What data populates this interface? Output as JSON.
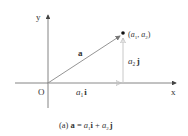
{
  "figure": {
    "axes": {
      "x_label": "x",
      "y_label": "y",
      "origin_label": "O"
    },
    "vector": {
      "name": "a",
      "point_label": {
        "open": "(",
        "a1": "a",
        "sub1": "1",
        "comma": ", ",
        "a2": "a",
        "sub2": "2",
        "close": ")"
      },
      "horizontal_component": {
        "coef": "a",
        "sub": "1",
        "unit": "i"
      },
      "vertical_component": {
        "coef": "a",
        "sub": "2",
        "unit": "j"
      }
    },
    "caption": {
      "tag": "(a) ",
      "lhs": "a",
      "eq": " = ",
      "c1": "a",
      "s1": "1",
      "u1": "i",
      "plus": " + ",
      "c2": "a",
      "s2": "2",
      "u2": "j"
    },
    "colors": {
      "axis": "#555555",
      "vector": "#777777",
      "component": "#bbbbbb",
      "point": "#111111",
      "text": "#333333"
    }
  }
}
